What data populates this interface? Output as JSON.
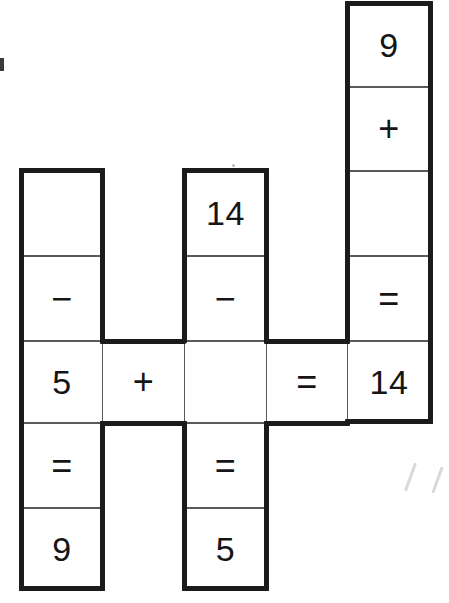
{
  "image": {
    "title": "Cross-number arithmetic puzzle grid",
    "width": 449,
    "height": 603,
    "background_color": "#ffffff",
    "ink_color": "#151515",
    "heavy_border_color": "#1b1b1b",
    "light_border_color": "#5a5a5a"
  },
  "puzzle": {
    "type": "cross-number",
    "cell_size": 82,
    "columns": [
      {
        "id": "column-a",
        "x": 21,
        "width": 81,
        "top": 170,
        "cells": [
          {
            "id": "a1",
            "row": 1,
            "value": "",
            "kind": "blank"
          },
          {
            "id": "a2",
            "row": 2,
            "value": "−",
            "kind": "operator"
          },
          {
            "id": "a3",
            "row": 3,
            "value": "5",
            "kind": "number"
          },
          {
            "id": "a4",
            "row": 4,
            "value": "=",
            "kind": "operator"
          },
          {
            "id": "a5",
            "row": 5,
            "value": "9",
            "kind": "number"
          }
        ]
      },
      {
        "id": "column-b",
        "x": 102,
        "width": 82,
        "top": 340,
        "cells": [
          {
            "id": "b3",
            "row": 3,
            "value": "+",
            "kind": "operator"
          }
        ]
      },
      {
        "id": "column-c",
        "x": 184,
        "width": 82,
        "top": 170,
        "cells": [
          {
            "id": "c1",
            "row": 1,
            "value": "14",
            "kind": "number"
          },
          {
            "id": "c2",
            "row": 2,
            "value": "−",
            "kind": "operator"
          },
          {
            "id": "c3",
            "row": 3,
            "value": "",
            "kind": "blank"
          },
          {
            "id": "c4",
            "row": 4,
            "value": "=",
            "kind": "operator"
          },
          {
            "id": "c5",
            "row": 5,
            "value": "5",
            "kind": "number"
          }
        ]
      },
      {
        "id": "column-d",
        "x": 266,
        "width": 81,
        "top": 340,
        "cells": [
          {
            "id": "d3",
            "row": 3,
            "value": "=",
            "kind": "operator"
          }
        ]
      },
      {
        "id": "column-e",
        "x": 347,
        "width": 83,
        "top": 3,
        "cells": [
          {
            "id": "e0",
            "row": 0,
            "value": "9",
            "kind": "number"
          },
          {
            "id": "e1",
            "row": 1,
            "value": "+",
            "kind": "operator"
          },
          {
            "id": "e2",
            "row": 2,
            "value": "",
            "kind": "blank"
          },
          {
            "id": "e3",
            "row": 3,
            "value": "=",
            "kind": "operator"
          },
          {
            "id": "e4",
            "row": 4,
            "value": "14",
            "kind": "number"
          }
        ]
      }
    ],
    "equations": {
      "horizontal": [
        {
          "id": "eq-row3",
          "text": "5 + ? = 14"
        }
      ],
      "vertical": [
        {
          "id": "eq-col-a",
          "text": "? − 5 = 9"
        },
        {
          "id": "eq-col-c",
          "text": "14 − ? = 5"
        },
        {
          "id": "eq-col-e",
          "text": "9 + ? = 14"
        }
      ]
    }
  }
}
